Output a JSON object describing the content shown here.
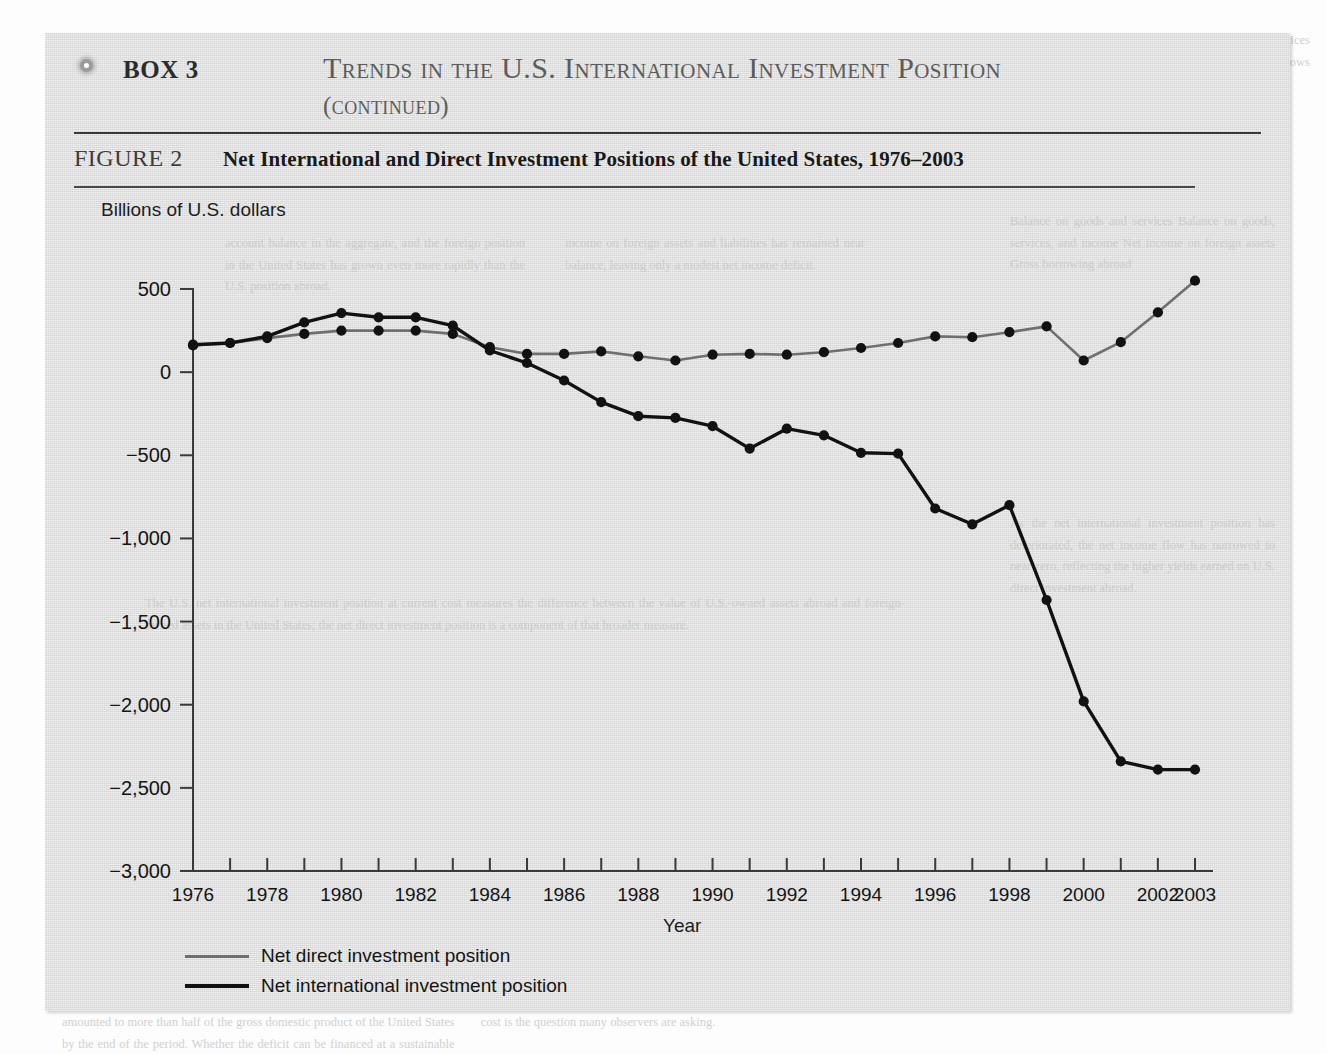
{
  "box": {
    "bullet_icon": "circle-bullet-icon",
    "label": "BOX 3",
    "title": "Trends in the U.S. International Investment Position",
    "title_continued": "(continued)"
  },
  "figure": {
    "label": "FIGURE 2",
    "title": "Net International and Direct Investment Positions of the United States, 1976–2003"
  },
  "legend": {
    "direct_label": "Net direct investment position",
    "international_label": "Net international investment position",
    "direct_color": "#6f6f6f",
    "international_color": "#111111"
  },
  "chart_data": {
    "type": "line",
    "title": "Net International and Direct Investment Positions of the United States, 1976–2003",
    "xlabel": "Year",
    "ylabel": "Billions of U.S. dollars",
    "ylim": [
      -3000,
      500
    ],
    "xlim": [
      1976,
      2003
    ],
    "y_ticks": [
      500,
      0,
      -500,
      -1000,
      -1500,
      -2000,
      -2500,
      -3000
    ],
    "y_tick_labels": [
      "500",
      "0",
      "−500",
      "−1,000",
      "−1,500",
      "−2,000",
      "−2,500",
      "−3,000"
    ],
    "x_ticks": [
      1976,
      1977,
      1978,
      1979,
      1980,
      1981,
      1982,
      1983,
      1984,
      1985,
      1986,
      1987,
      1988,
      1989,
      1990,
      1991,
      1992,
      1993,
      1994,
      1995,
      1996,
      1997,
      1998,
      1999,
      2000,
      2001,
      2002,
      2003
    ],
    "x_tick_labels": [
      "1976",
      "",
      "1978",
      "",
      "1980",
      "",
      "1982",
      "",
      "1984",
      "",
      "1986",
      "",
      "1988",
      "",
      "1990",
      "",
      "1992",
      "",
      "1994",
      "",
      "1996",
      "",
      "1998",
      "",
      "2000",
      "",
      "2002",
      "2003"
    ],
    "grid": false,
    "legend_position": "below-left",
    "markers": true,
    "x": [
      1976,
      1977,
      1978,
      1979,
      1980,
      1981,
      1982,
      1983,
      1984,
      1985,
      1986,
      1987,
      1988,
      1989,
      1990,
      1991,
      1992,
      1993,
      1994,
      1995,
      1996,
      1997,
      1998,
      1999,
      2000,
      2001,
      2002,
      2003
    ],
    "series": [
      {
        "name": "Net direct investment position",
        "color": "#6f6f6f",
        "values": [
          160,
          175,
          205,
          230,
          250,
          250,
          250,
          230,
          150,
          110,
          110,
          125,
          95,
          70,
          105,
          110,
          105,
          120,
          145,
          175,
          215,
          210,
          240,
          275,
          70,
          180,
          360,
          550
        ]
      },
      {
        "name": "Net international investment position",
        "color": "#111111",
        "values": [
          165,
          175,
          215,
          300,
          355,
          330,
          330,
          280,
          130,
          55,
          -50,
          -180,
          -265,
          -275,
          -325,
          -460,
          -340,
          -380,
          -485,
          -490,
          -820,
          -915,
          -800,
          -1370,
          -1980,
          -2340,
          -2390,
          -2390
        ]
      }
    ]
  }
}
